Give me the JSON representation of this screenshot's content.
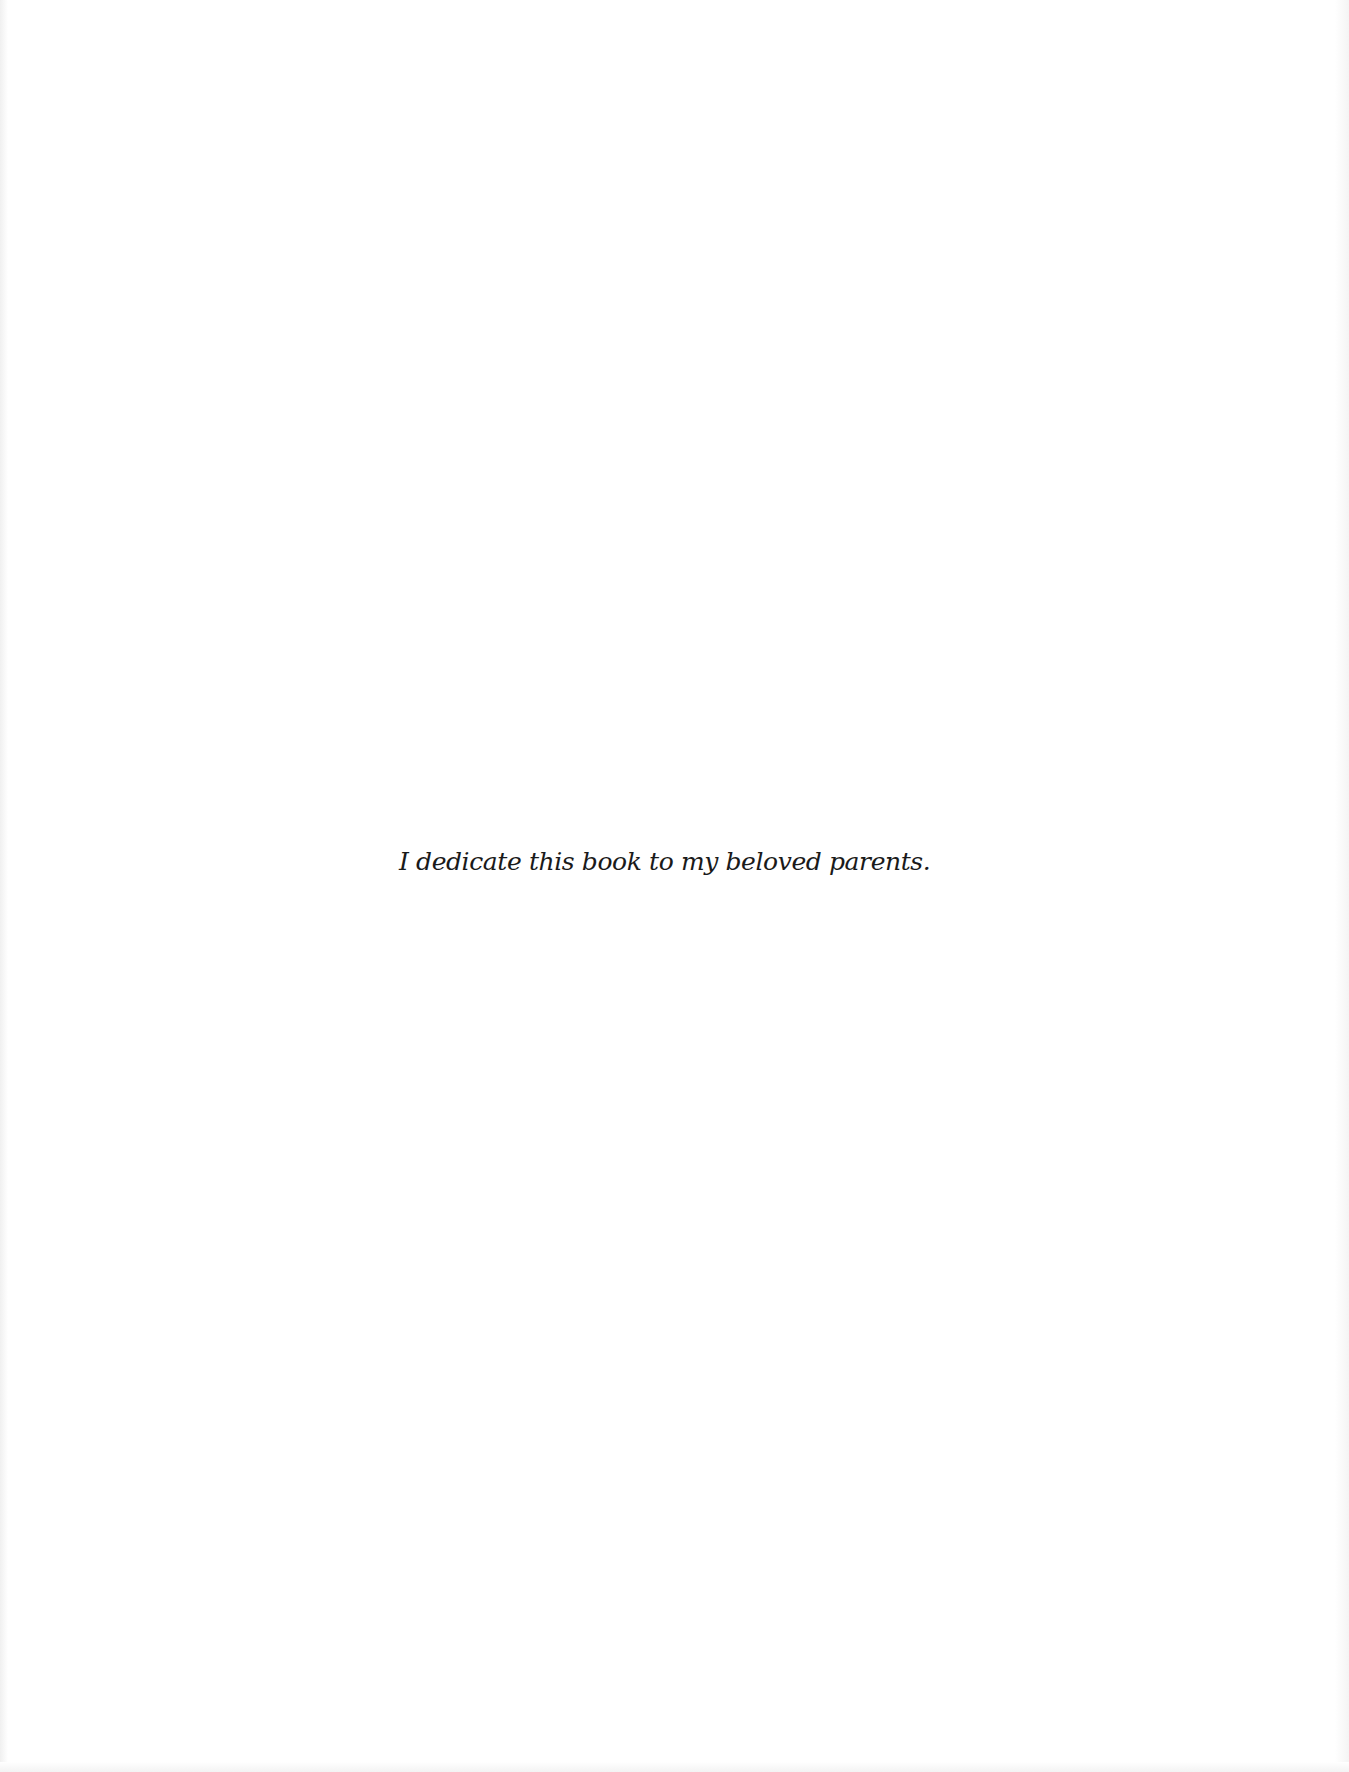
{
  "page": {
    "dedication_text": "I dedicate this book to my beloved parents.",
    "background_color": "#ffffff",
    "text_color": "#1a1a1a"
  }
}
